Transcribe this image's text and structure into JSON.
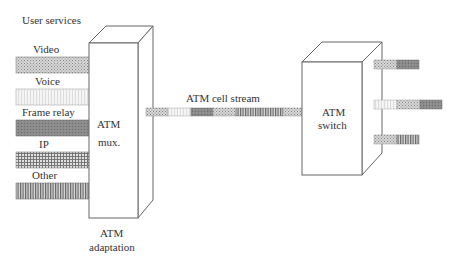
{
  "title": "User services",
  "services": [
    {
      "label": "Video",
      "pattern": "dots"
    },
    {
      "label": "Voice",
      "pattern": "light"
    },
    {
      "label": "Frame relay",
      "pattern": "dark"
    },
    {
      "label": "IP",
      "pattern": "grid"
    },
    {
      "label": "Other",
      "pattern": "vstripes"
    }
  ],
  "mux": {
    "line1": "ATM",
    "line2": "mux."
  },
  "adaptation": {
    "line1": "ATM",
    "line2": "adaptation"
  },
  "stream": {
    "label": "ATM cell stream",
    "cells": [
      "dots",
      "light",
      "dark",
      "dots",
      "vstripes",
      "vstripes",
      "dots"
    ]
  },
  "switch": {
    "line1": "ATM",
    "line2": "switch"
  },
  "outputs": [
    {
      "cells": [
        "dots",
        "dark"
      ]
    },
    {
      "cells": [
        "light",
        "dots",
        "dark"
      ]
    },
    {
      "cells": [
        "dots",
        "vstripes"
      ]
    }
  ],
  "colors": {
    "line": "#666666",
    "background": "#ffffff"
  }
}
